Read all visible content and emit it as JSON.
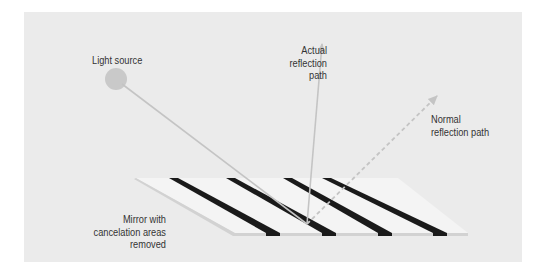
{
  "diagram": {
    "title": "",
    "colors": {
      "background": "#ebebeb",
      "mirror_surface": "#f4f4f4",
      "mirror_edge": "#d2d2d2",
      "stripes": "#1a1a1a",
      "light_source": "#c9c9c9",
      "rays": "#c4c4c4"
    },
    "labels": {
      "light_source": "Light source",
      "actual_reflection": [
        "Actual",
        "reflection",
        "path"
      ],
      "normal_reflection": [
        "Normal",
        "reflection path"
      ],
      "mirror": [
        "Mirror with",
        "cancelation areas",
        "removed"
      ]
    },
    "elements": {
      "light_source": {
        "shape": "circle",
        "cx": 116,
        "cy": 79,
        "r": 11
      },
      "incident_ray": {
        "from": [
          116,
          79
        ],
        "to": [
          307,
          224
        ],
        "style": "solid"
      },
      "actual_reflection_ray": {
        "from": [
          307,
          224
        ],
        "to": [
          322,
          42
        ],
        "style": "solid-arrow"
      },
      "normal_reflection_ray": {
        "from": [
          307,
          224
        ],
        "to": [
          439,
          94
        ],
        "style": "dashed-arrow"
      },
      "mirror": {
        "shape": "parallelogram",
        "stripe_count": 4
      }
    }
  }
}
